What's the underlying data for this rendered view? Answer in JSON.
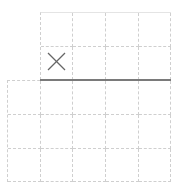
{
  "grid": {
    "column_width": 33,
    "row_height": 34,
    "top_region": {
      "columns": 4,
      "rows": 2
    },
    "bottom_region": {
      "columns": 5,
      "rows": 3
    }
  },
  "marks": [
    {
      "symbol": "×",
      "icon": "x-mark-icon",
      "row": 2,
      "column": 1
    }
  ],
  "separator": {
    "color": "#7a7a7a"
  },
  "colors": {
    "grid_line": "#cfcfcf",
    "mark": "#666666",
    "background": "#ffffff"
  }
}
